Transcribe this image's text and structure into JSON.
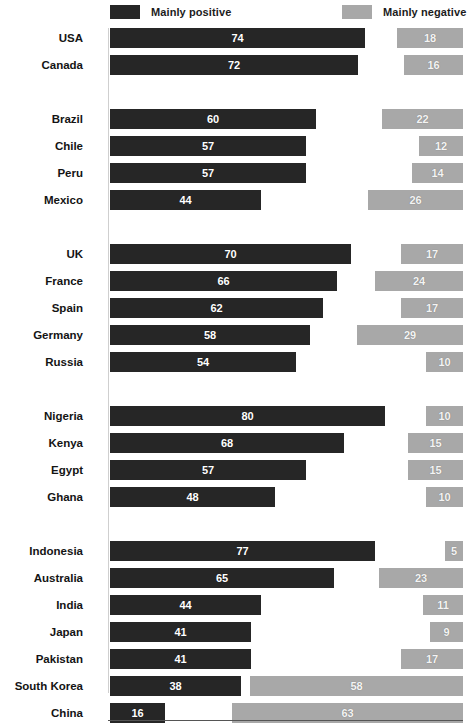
{
  "legend": {
    "positive_label": "Mainly positive",
    "negative_label": "Mainly negative",
    "positive_color": "#262626",
    "negative_color": "#a8a8a8"
  },
  "chart_data": {
    "type": "bar",
    "title": "",
    "subtitle": "",
    "xlabel": "",
    "ylabel": "",
    "orientation": "horizontal",
    "layout": "diverging",
    "grid": false,
    "legend_position": "top",
    "xlim": [
      0,
      80
    ],
    "categories": [
      "USA",
      "Canada",
      "Brazil",
      "Chile",
      "Peru",
      "Mexico",
      "UK",
      "France",
      "Spain",
      "Germany",
      "Russia",
      "Nigeria",
      "Kenya",
      "Egypt",
      "Ghana",
      "Indonesia",
      "Australia",
      "India",
      "Japan",
      "Pakistan",
      "South Korea",
      "China",
      "Global average\n(Japan excluded)"
    ],
    "series": [
      {
        "name": "Mainly positive",
        "color": "#262626",
        "values": [
          74,
          72,
          60,
          57,
          57,
          44,
          70,
          66,
          62,
          58,
          54,
          80,
          68,
          57,
          48,
          77,
          65,
          44,
          41,
          41,
          38,
          16,
          58
        ]
      },
      {
        "name": "Mainly negative",
        "color": "#a8a8a8",
        "values": [
          18,
          16,
          22,
          12,
          14,
          26,
          17,
          24,
          17,
          29,
          10,
          10,
          15,
          15,
          10,
          5,
          23,
          11,
          9,
          17,
          58,
          63,
          21
        ]
      }
    ],
    "groups": [
      {
        "rows": [
          {
            "label": "USA",
            "positive": 74,
            "negative": 18
          },
          {
            "label": "Canada",
            "positive": 72,
            "negative": 16
          }
        ]
      },
      {
        "rows": [
          {
            "label": "Brazil",
            "positive": 60,
            "negative": 22
          },
          {
            "label": "Chile",
            "positive": 57,
            "negative": 12
          },
          {
            "label": "Peru",
            "positive": 57,
            "negative": 14
          },
          {
            "label": "Mexico",
            "positive": 44,
            "negative": 26
          }
        ]
      },
      {
        "rows": [
          {
            "label": "UK",
            "positive": 70,
            "negative": 17
          },
          {
            "label": "France",
            "positive": 66,
            "negative": 24
          },
          {
            "label": "Spain",
            "positive": 62,
            "negative": 17
          },
          {
            "label": "Germany",
            "positive": 58,
            "negative": 29
          },
          {
            "label": "Russia",
            "positive": 54,
            "negative": 10
          }
        ]
      },
      {
        "rows": [
          {
            "label": "Nigeria",
            "positive": 80,
            "negative": 10
          },
          {
            "label": "Kenya",
            "positive": 68,
            "negative": 15
          },
          {
            "label": "Egypt",
            "positive": 57,
            "negative": 15
          },
          {
            "label": "Ghana",
            "positive": 48,
            "negative": 10
          }
        ]
      },
      {
        "rows": [
          {
            "label": "Indonesia",
            "positive": 77,
            "negative": 5
          },
          {
            "label": "Australia",
            "positive": 65,
            "negative": 23
          },
          {
            "label": "India",
            "positive": 44,
            "negative": 11
          },
          {
            "label": "Japan",
            "positive": 41,
            "negative": 9
          },
          {
            "label": "Pakistan",
            "positive": 41,
            "negative": 17
          },
          {
            "label": "South Korea",
            "positive": 38,
            "negative": 58
          },
          {
            "label": "China",
            "positive": 16,
            "negative": 63
          }
        ]
      },
      {
        "rows": [
          {
            "label": "Global average\n(Japan excluded)",
            "label_line1": "Global average",
            "label_line2": "(Japan excluded)",
            "positive": 58,
            "negative": 21
          }
        ]
      }
    ]
  }
}
